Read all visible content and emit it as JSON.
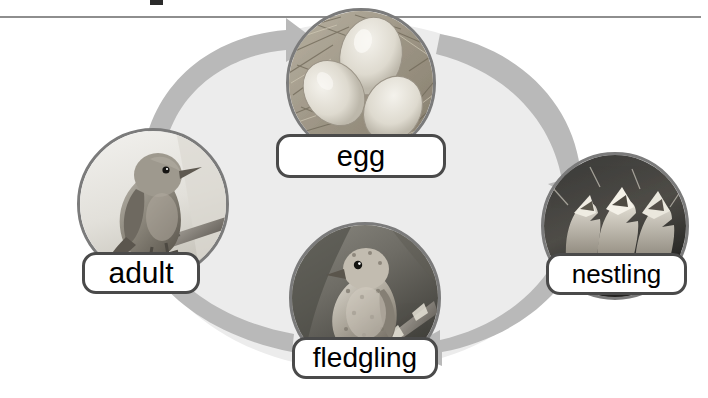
{
  "figure": {
    "kind": "life-cycle-diagram",
    "background_color": "#ffffff",
    "ring_fill_color": "#ececec",
    "arrow_color": "#b9b9b9",
    "label_border_color": "#4a4a4a",
    "label_text_color": "#000000",
    "photo_border_color": "#7b7b7b",
    "rule_color": "#8e8e8e"
  },
  "stages": [
    {
      "id": "egg",
      "label": "egg",
      "position": "top",
      "photo": "eggs-in-nest-photo",
      "photo_description": "three pale eggs in a straw nest"
    },
    {
      "id": "nestling",
      "label": "nestling",
      "position": "right",
      "photo": "nestlings-photo",
      "photo_description": "nestlings with open beaks in a dark nest"
    },
    {
      "id": "fledgling",
      "label": "fledgling",
      "position": "bottom",
      "photo": "fledgling-photo",
      "photo_description": "young speckled bird perched on a branch"
    },
    {
      "id": "adult",
      "label": "adult",
      "position": "left",
      "photo": "adult-bird-photo",
      "photo_description": "adult robin perched on a branch"
    }
  ],
  "arrows": [
    {
      "id": "adult-to-egg",
      "from": "adult",
      "to": "egg",
      "direction": "clockwise"
    },
    {
      "id": "egg-to-nestling",
      "from": "egg",
      "to": "nestling",
      "direction": "clockwise"
    },
    {
      "id": "nestling-to-fledgling",
      "from": "nestling",
      "to": "fledgling",
      "direction": "clockwise"
    },
    {
      "id": "fledgling-to-adult",
      "from": "fledgling",
      "to": "adult",
      "direction": "clockwise"
    }
  ]
}
